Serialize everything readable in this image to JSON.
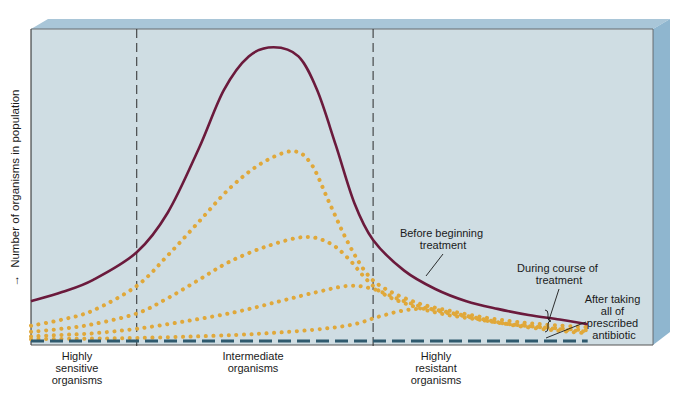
{
  "chart_data": {
    "type": "line",
    "title": "",
    "xlabel": "",
    "ylabel": "Number of organisms in population",
    "ylabel_arrow": "→",
    "grid": false,
    "axis_ticks": "none",
    "x_range": [
      0,
      100
    ],
    "y_range": [
      0,
      100
    ],
    "regions": [
      {
        "label_lines": [
          "Highly",
          "sensitive",
          "organisms"
        ],
        "x_range": [
          0,
          17
        ]
      },
      {
        "label_lines": [
          "Intermediate",
          "organisms"
        ],
        "x_range": [
          17,
          55
        ]
      },
      {
        "label_lines": [
          "Highly",
          "resistant",
          "organisms"
        ],
        "x_range": [
          55,
          100
        ]
      }
    ],
    "region_dividers_x": [
      17,
      55
    ],
    "colors": {
      "background": "#cfdde3",
      "box_side": "#8fb6cf",
      "box_top": "#a9c6d8",
      "before_treatment": "#6b1a3c",
      "during_treatment": "#e0a83a",
      "after_treatment": "#2f5a6e",
      "divider": "#2b2b2b"
    },
    "series": [
      {
        "name": "Before beginning treatment",
        "style": "solid",
        "x": [
          0,
          5,
          10,
          17,
          22,
          27,
          31,
          35,
          39,
          43,
          46,
          49,
          52,
          55,
          60,
          65,
          70,
          75,
          80,
          85,
          89.5
        ],
        "y": [
          13,
          16,
          20,
          29,
          42,
          63,
          82,
          93,
          96,
          93,
          82,
          64,
          45,
          33,
          23,
          17,
          13,
          10.5,
          8.5,
          7,
          5.5
        ]
      },
      {
        "name": "During course of treatment (1)",
        "style": "dotted",
        "x": [
          0,
          5,
          10,
          17,
          22,
          27,
          32,
          37,
          42,
          45,
          48,
          51,
          54,
          57,
          62,
          67,
          72,
          77,
          82,
          89.5
        ],
        "y": [
          5,
          7,
          10,
          18,
          28,
          39,
          50,
          58,
          62,
          58,
          45,
          32,
          22,
          17,
          12.5,
          10,
          8,
          6.5,
          5.5,
          4.5
        ]
      },
      {
        "name": "During course of treatment (2)",
        "style": "dotted",
        "x": [
          0,
          5,
          10,
          17,
          22,
          27,
          32,
          38,
          44,
          48,
          51,
          54,
          57,
          62,
          67,
          72,
          77,
          82,
          89.5
        ],
        "y": [
          3,
          4,
          5.5,
          9,
          14,
          20,
          26,
          31,
          34,
          32,
          27,
          20,
          15,
          11,
          8.5,
          7,
          5.5,
          4.5,
          3.5
        ]
      },
      {
        "name": "During course of treatment (3)",
        "style": "dotted",
        "x": [
          0,
          5,
          10,
          17,
          25,
          33,
          40,
          46,
          51,
          55,
          60,
          65,
          70,
          75,
          82,
          89.5
        ],
        "y": [
          1.5,
          2,
          2.5,
          4,
          6.5,
          9.5,
          13,
          16,
          18,
          17,
          13,
          10,
          8,
          6,
          4.5,
          3
        ]
      },
      {
        "name": "During course of treatment (4)",
        "style": "dotted",
        "x": [
          0,
          10,
          17,
          25,
          33,
          40,
          47,
          52,
          56,
          60,
          64,
          68,
          73,
          78,
          84,
          89.5
        ],
        "y": [
          0.6,
          0.8,
          1,
          1.4,
          2,
          2.8,
          4,
          5.5,
          8,
          10,
          10.5,
          9,
          7,
          5,
          3.5,
          2.5
        ]
      },
      {
        "name": "After taking all of prescribed antibiotic",
        "style": "dashed",
        "x": [
          0,
          89.5
        ],
        "y": [
          0,
          0
        ]
      }
    ],
    "annotations": [
      {
        "text_lines": [
          "Before beginning",
          "treatment"
        ],
        "points_to": "Before beginning treatment"
      },
      {
        "text_lines": [
          "During course of",
          "treatment"
        ],
        "points_to": "During course of treatment"
      },
      {
        "text_lines": [
          "After taking",
          "all of",
          "prescribed",
          "antibiotic"
        ],
        "points_to": "After taking all of prescribed antibiotic"
      }
    ]
  }
}
